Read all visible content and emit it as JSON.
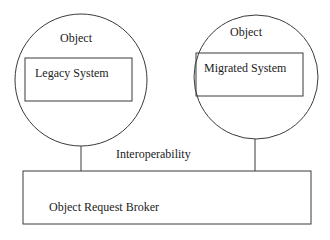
{
  "diagram": {
    "type": "architecture",
    "colors": {
      "stroke": "#3a3a3a",
      "text": "#222222",
      "background": "#ffffff"
    },
    "nodes": [
      {
        "id": "object-left",
        "shape": "circle",
        "label": "Object",
        "cx": 81,
        "cy": 80,
        "r": 66
      },
      {
        "id": "legacy-system",
        "shape": "rect",
        "label": "Legacy System",
        "parent": "object-left",
        "x": 25,
        "y": 58,
        "w": 107,
        "h": 43
      },
      {
        "id": "object-right",
        "shape": "circle",
        "label": "Object",
        "cx": 256,
        "cy": 77,
        "r": 62
      },
      {
        "id": "migrated-system",
        "shape": "rect",
        "label": "Migrated System",
        "parent": "object-right",
        "x": 196,
        "y": 53,
        "w": 107,
        "h": 43
      },
      {
        "id": "orb",
        "shape": "rect",
        "label": "Object Request Broker",
        "x": 23,
        "y": 171,
        "w": 288,
        "h": 53
      }
    ],
    "edges": [
      {
        "from": "object-left",
        "to": "orb"
      },
      {
        "from": "object-right",
        "to": "orb"
      }
    ],
    "annotations": [
      {
        "text": "Interoperability",
        "x": 116,
        "y": 158
      }
    ]
  }
}
